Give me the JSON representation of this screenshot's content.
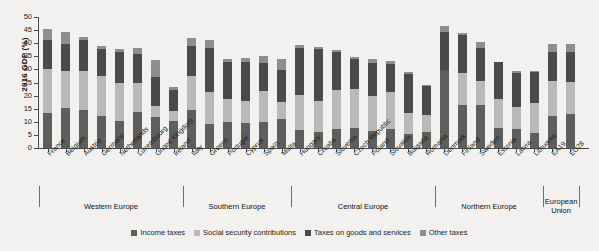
{
  "chart_data": {
    "type": "bar",
    "stacked": true,
    "title": "",
    "xlabel": "",
    "ylabel": "2016 GDP (%)",
    "ylim": [
      0,
      50
    ],
    "yticks": [
      0,
      5,
      10,
      15,
      20,
      25,
      30,
      35,
      40,
      45,
      50
    ],
    "grid": false,
    "legend_position": "bottom",
    "categories": [
      "France",
      "Belgium",
      "Austria",
      "Germany",
      "Netherlands",
      "Luxembourg",
      "United Kingdom",
      "Ireland",
      "Italy",
      "Greece",
      "Portugal",
      "Cyprus",
      "Spain",
      "Malta",
      "Hungary",
      "Croatia",
      "Slovenia",
      "Czech Republic",
      "Poland",
      "Slovakia",
      "Bulgaria",
      "Romania",
      "Denmark",
      "Finland",
      "Sweden",
      "Estonia",
      "Latvia",
      "Lithuania",
      "EA19",
      "EU28"
    ],
    "series": [
      {
        "name": "Income taxes",
        "color": "#5e5e5e",
        "values": [
          13.3,
          15.3,
          14.4,
          12.1,
          10.5,
          13.9,
          11.8,
          10.3,
          14.4,
          9.0,
          9.8,
          9.4,
          10.0,
          11.2,
          7.0,
          6.2,
          7.3,
          7.6,
          6.6,
          7.2,
          5.4,
          6.2,
          29.7,
          16.4,
          16.6,
          7.6,
          7.4,
          5.6,
          12.1,
          13.0
        ]
      },
      {
        "name": "Social security contributions",
        "color": "#b9b9b7",
        "values": [
          16.9,
          14.2,
          14.9,
          15.3,
          14.5,
          11.1,
          4.4,
          3.8,
          13.1,
          12.5,
          9.1,
          8.4,
          11.8,
          6.2,
          13.1,
          11.7,
          14.9,
          14.9,
          13.2,
          14.0,
          8.1,
          6.5,
          0.1,
          12.4,
          9.1,
          11.2,
          8.4,
          11.7,
          13.3,
          12.2
        ]
      },
      {
        "name": "Taxes on goods and services",
        "color": "#4a4a4a",
        "values": [
          11.1,
          10.3,
          12.1,
          10.3,
          11.5,
          10.8,
          11.0,
          8.0,
          11.6,
          16.6,
          14.0,
          15.0,
          10.6,
          12.3,
          18.2,
          19.9,
          14.5,
          11.6,
          12.8,
          11.0,
          14.9,
          11.1,
          14.5,
          14.4,
          12.3,
          13.9,
          12.9,
          11.6,
          11.4,
          11.5
        ]
      },
      {
        "name": "Other taxes",
        "color": "#8e8e8c",
        "values": [
          4.3,
          4.6,
          1.0,
          1.3,
          1.3,
          2.4,
          6.3,
          1.2,
          2.9,
          3.0,
          1.2,
          1.7,
          2.6,
          4.3,
          1.0,
          0.8,
          0.7,
          0.7,
          1.5,
          0.9,
          0.5,
          0.4,
          2.4,
          0.8,
          2.3,
          0.3,
          0.8,
          0.5,
          2.8,
          3.0
        ]
      }
    ],
    "groups": [
      {
        "label": "Western Europe",
        "start": 0,
        "end": 7
      },
      {
        "label": "Southern Europe",
        "start": 8,
        "end": 13
      },
      {
        "label": "Central Europe",
        "start": 14,
        "end": 21
      },
      {
        "label": "Northern Europe",
        "start": 22,
        "end": 27
      },
      {
        "label": "European\nUnion",
        "start": 28,
        "end": 29
      }
    ],
    "legend": [
      {
        "label": "Income taxes",
        "color": "#5e5e5e"
      },
      {
        "label": "Social security contributions",
        "color": "#b9b9b7"
      },
      {
        "label": "Taxes on goods and services",
        "color": "#4a4a4a"
      },
      {
        "label": "Other taxes",
        "color": "#8e8e8c"
      }
    ]
  }
}
